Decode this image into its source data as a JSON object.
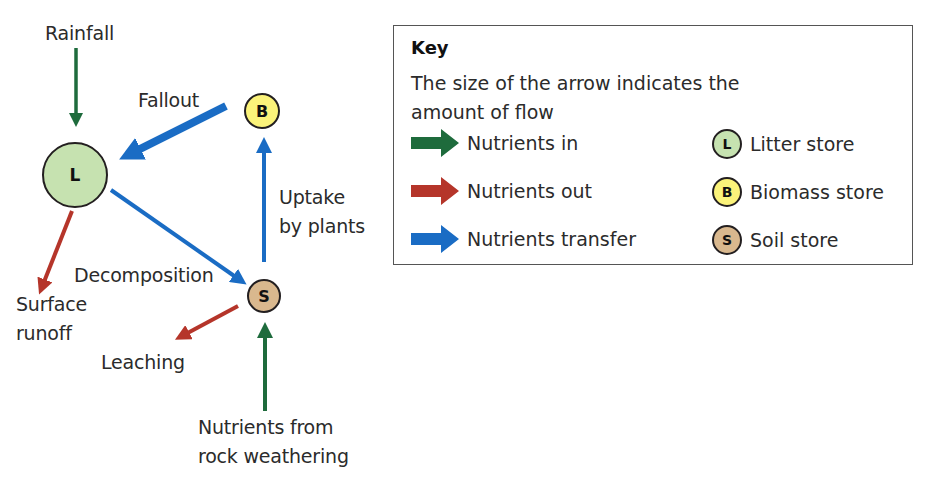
{
  "colors": {
    "nutrients_in": "#1e6b3c",
    "nutrients_out": "#b5352a",
    "nutrients_transfer": "#1a6cc4",
    "litter_fill": "#c6e2b0",
    "biomass_fill": "#fbf37a",
    "soil_fill": "#d9b88e",
    "border": "#231f20"
  },
  "nodes": {
    "litter": {
      "letter": "L",
      "store": "Litter store"
    },
    "biomass": {
      "letter": "B",
      "store": "Biomass store"
    },
    "soil": {
      "letter": "S",
      "store": "Soil store"
    }
  },
  "flows": {
    "rainfall": {
      "label": "Rainfall",
      "type": "in",
      "from": "outside",
      "to": "L"
    },
    "fallout": {
      "label": "Fallout",
      "type": "transfer",
      "from": "B",
      "to": "L"
    },
    "uptake": {
      "label_line1": "Uptake",
      "label_line2": "by plants",
      "type": "transfer",
      "from": "S",
      "to": "B"
    },
    "decomposition": {
      "label": "Decomposition",
      "type": "transfer",
      "from": "L",
      "to": "S"
    },
    "surface_runoff": {
      "label_line1": "Surface",
      "label_line2": "runoff",
      "type": "out",
      "from": "L",
      "to": "outside"
    },
    "leaching": {
      "label": "Leaching",
      "type": "out",
      "from": "S",
      "to": "outside"
    },
    "weathering": {
      "label_line1": "Nutrients from",
      "label_line2": "rock weathering",
      "type": "in",
      "from": "outside",
      "to": "S"
    }
  },
  "key": {
    "title": "Key",
    "description": "The size of the arrow indicates the amount of flow",
    "arrows": [
      {
        "label": "Nutrients in",
        "color": "#1e6b3c"
      },
      {
        "label": "Nutrients out",
        "color": "#b5352a"
      },
      {
        "label": "Nutrients transfer",
        "color": "#1a6cc4"
      }
    ],
    "stores": [
      {
        "letter": "L",
        "label": "Litter store",
        "fill": "#c6e2b0"
      },
      {
        "letter": "B",
        "label": "Biomass store",
        "fill": "#fbf37a"
      },
      {
        "letter": "S",
        "label": "Soil store",
        "fill": "#d9b88e"
      }
    ]
  }
}
